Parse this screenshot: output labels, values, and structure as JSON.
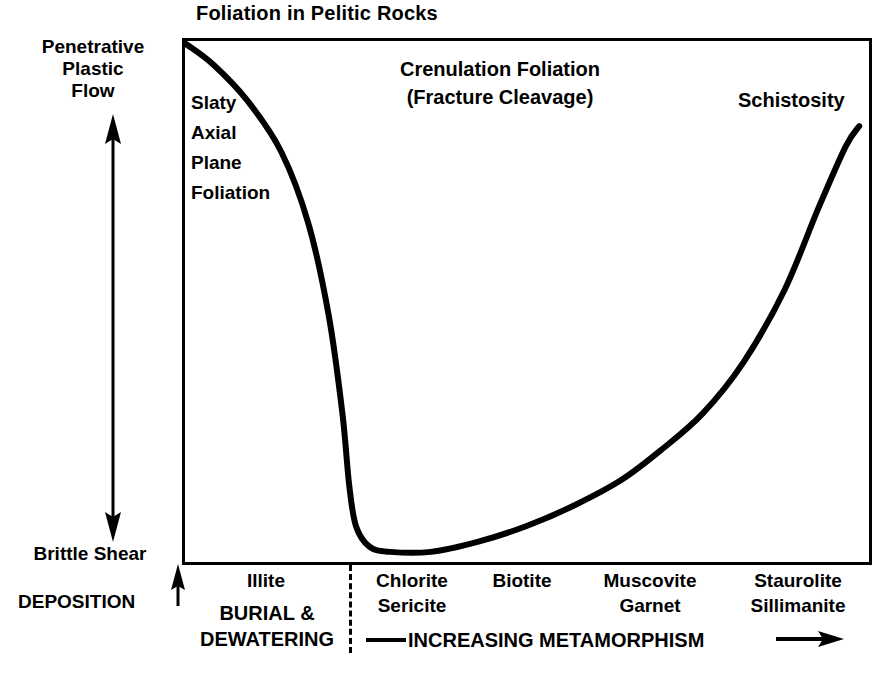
{
  "chart_data": {
    "type": "line",
    "title": "Foliation in Pelitic Rocks",
    "xlabel": "INCREASING METAMORPHISM",
    "ylabel": "Penetrative Plastic Flow / Brittle Shear",
    "grid": false,
    "legend": null,
    "xlim": [
      0,
      100
    ],
    "ylim": [
      0,
      100
    ],
    "x_axis_ticks": [
      "Illite",
      "Chlorite Sericite",
      "Biotite",
      "Muscovite Garnet",
      "Staurolite Sillimanite"
    ],
    "y_axis_endpoints": [
      "Brittle Shear",
      "Penetrative Plastic Flow"
    ],
    "series": [
      {
        "name": "Foliation intensity",
        "x": [
          0,
          4,
          9,
          14,
          18,
          21,
          23,
          24,
          25,
          27,
          30,
          36,
          43,
          50,
          57,
          64,
          70,
          76,
          82,
          88,
          93,
          97,
          99
        ],
        "y": [
          100,
          96,
          89,
          79,
          65,
          47,
          28,
          14,
          6,
          2,
          1,
          1,
          3,
          6,
          10,
          15,
          21,
          28,
          38,
          52,
          68,
          80,
          84
        ]
      }
    ],
    "annotations": [
      "Slaty Axial Plane Foliation",
      "Crenulation Foliation (Fracture Cleavage)",
      "Schistosity"
    ]
  },
  "title": "Foliation in Pelitic Rocks",
  "y_axis": {
    "top_label": "Penetrative\nPlastic\nFlow",
    "top_label_lines": [
      "Penetrative",
      "Plastic",
      "Flow"
    ],
    "bottom_label": "Brittle Shear",
    "arrow_up_name": "up-arrow-icon",
    "arrow_down_name": "down-arrow-icon"
  },
  "deposition": {
    "label": "DEPOSITION",
    "arrow": "up-arrow-icon"
  },
  "plot_labels": {
    "slaty": [
      "Slaty",
      "Axial",
      "Plane",
      "Foliation"
    ],
    "crenulation_line1": "Crenulation Foliation",
    "crenulation_line2": "(Fracture Cleavage)",
    "schistosity": "Schistosity"
  },
  "x_axis": {
    "zones": [
      {
        "id": "illite",
        "lines": [
          "Illite"
        ]
      },
      {
        "id": "chlorite",
        "lines": [
          "Chlorite",
          "Sericite"
        ]
      },
      {
        "id": "biotite",
        "lines": [
          "Biotite"
        ]
      },
      {
        "id": "muscovite",
        "lines": [
          "Muscovite",
          "Garnet"
        ]
      },
      {
        "id": "staurolite",
        "lines": [
          "Staurolite",
          "Sillimanite"
        ]
      }
    ],
    "zone_illite_l1": "Illite",
    "zone_chlorite_l1": "Chlorite",
    "zone_chlorite_l2": "Sericite",
    "zone_biotite_l1": "Biotite",
    "zone_muscovite_l1": "Muscovite",
    "zone_muscovite_l2": "Garnet",
    "zone_staurolite_l1": "Staurolite",
    "zone_staurolite_l2": "Sillimanite",
    "burial_l1": "BURIAL &",
    "burial_l2": "DEWATERING",
    "metamorphism": "INCREASING METAMORPHISM",
    "metamorphism_arrow": "right-arrow-icon"
  },
  "colors": {
    "ink": "#000000",
    "paper": "#ffffff"
  }
}
